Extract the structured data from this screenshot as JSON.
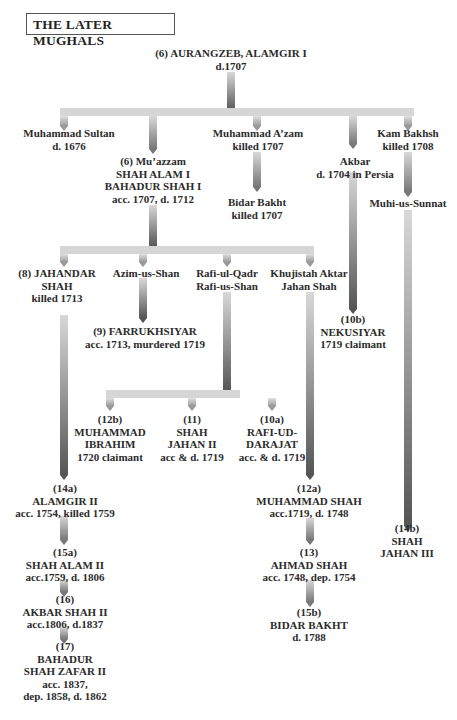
{
  "title": "THE LATER MUGHALS",
  "nodes": {
    "aurangzeb": {
      "lines": [
        "(6)  AURANGZEB, ALAMGIR I",
        "d.1707"
      ]
    },
    "muhammad_sultan": {
      "lines": [
        "Muhammad Sultan",
        "d. 1676"
      ]
    },
    "muazzam": {
      "lines": [
        "(6)  Mu’azzam",
        "SHAH ALAM I",
        "BAHADUR SHAH I",
        "acc. 1707, d. 1712"
      ]
    },
    "muhammad_azam": {
      "lines": [
        "Muhammad A’zam",
        "killed 1707"
      ]
    },
    "bidar_bakht_1": {
      "lines": [
        "Bidar Bakht",
        "killed 1707"
      ]
    },
    "akbar": {
      "lines": [
        "Akbar",
        "d. 1704 in Persia"
      ]
    },
    "kam_bakhsh": {
      "lines": [
        "Kam Bakhsh",
        "killed 1708"
      ]
    },
    "muhi_us_sunnat": {
      "lines": [
        "Muhi-us-Sunnat"
      ]
    },
    "jahandar": {
      "lines": [
        "(8)  JAHANDAR",
        "SHAH",
        "killed 1713"
      ]
    },
    "azim_us_shan": {
      "lines": [
        "Azim-us-Shan"
      ]
    },
    "rafi_ul_qadr": {
      "lines": [
        "Rafi-ul-Qadr",
        "Rafi-us-Shan"
      ]
    },
    "khujistah": {
      "lines": [
        "Khujistah Aktar",
        "Jahan Shah"
      ]
    },
    "farrukhsiyar": {
      "lines": [
        "(9)  FARRUKHSIYAR",
        "acc. 1713,  murdered 1719"
      ]
    },
    "nekusiyar": {
      "lines": [
        "(10b)",
        "NEKUSIYAR",
        "1719 claimant"
      ]
    },
    "muhammad_ibrahim": {
      "lines": [
        "(12b)",
        "MUHAMMAD",
        "IBRAHIM",
        "1720 claimant"
      ]
    },
    "shah_jahan_ii": {
      "lines": [
        "(11)",
        "SHAH",
        "JAHAN II",
        "acc & d. 1719"
      ]
    },
    "rafi_ud_darajat": {
      "lines": [
        "(10a)",
        "RAFI-UD-",
        "DARAJAT",
        "acc. & d. 1719"
      ]
    },
    "alamgir_ii": {
      "lines": [
        "(14a)",
        "ALAMGIR II",
        "acc. 1754, killed 1759"
      ]
    },
    "muhammad_shah": {
      "lines": [
        "(12a)",
        "MUHAMMAD SHAH",
        "acc.1719, d. 1748"
      ]
    },
    "shah_jahan_iii": {
      "lines": [
        "(14b)",
        "SHAH",
        "JAHAN III"
      ]
    },
    "shah_alam_ii": {
      "lines": [
        "(15a)",
        "SHAH ALAM II",
        "acc.1759, d. 1806"
      ]
    },
    "ahmad_shah": {
      "lines": [
        "(13)",
        "AHMAD SHAH",
        "acc. 1748, dep. 1754"
      ]
    },
    "akbar_shah_ii": {
      "lines": [
        "(16)",
        "AKBAR SHAH II",
        "acc.1806, d.1837"
      ]
    },
    "bidar_bakht_2": {
      "lines": [
        "(15b)",
        "BIDAR BAKHT",
        "d. 1788"
      ]
    },
    "bahadur_shah_zafar": {
      "lines": [
        "(17)",
        "BAHADUR",
        "SHAH ZAFAR II",
        "acc. 1837,",
        "dep. 1858, d. 1862"
      ]
    }
  },
  "colors": {
    "bar": "#d6d6d6",
    "arrow_dark": "#555555",
    "text": "#2b2b2b"
  }
}
